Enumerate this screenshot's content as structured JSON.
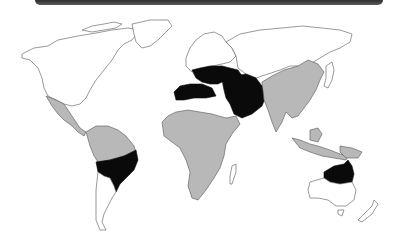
{
  "header": {
    "bar_color": "#444444"
  },
  "map": {
    "type": "world-choropleth",
    "legend_categories": [
      {
        "id": "black",
        "color": "#0a0a0a"
      },
      {
        "id": "gray",
        "color": "#b8b8b8"
      },
      {
        "id": "white",
        "color": "#ffffff"
      }
    ],
    "regions": [
      {
        "name": "North America",
        "category": "white"
      },
      {
        "name": "Greenland",
        "category": "white"
      },
      {
        "name": "Mexico & Central America",
        "category": "gray"
      },
      {
        "name": "Northern South America",
        "category": "gray"
      },
      {
        "name": "Central South America (Brazil/Paraguay/Bolivia)",
        "category": "black"
      },
      {
        "name": "Southern South America",
        "category": "white"
      },
      {
        "name": "Europe",
        "category": "white"
      },
      {
        "name": "Southern Europe & Mediterranean",
        "category": "black"
      },
      {
        "name": "North Africa coast",
        "category": "black"
      },
      {
        "name": "Middle East & Arabian Peninsula",
        "category": "black"
      },
      {
        "name": "Sub-Saharan Africa",
        "category": "gray"
      },
      {
        "name": "Madagascar",
        "category": "white"
      },
      {
        "name": "Russia & Northern Asia",
        "category": "white"
      },
      {
        "name": "South & East Asia",
        "category": "gray"
      },
      {
        "name": "Southeast Asia & Indonesia",
        "category": "gray"
      },
      {
        "name": "Japan",
        "category": "white"
      },
      {
        "name": "Northern Australia",
        "category": "black"
      },
      {
        "name": "Southern Australia",
        "category": "white"
      },
      {
        "name": "New Zealand",
        "category": "white"
      }
    ]
  }
}
